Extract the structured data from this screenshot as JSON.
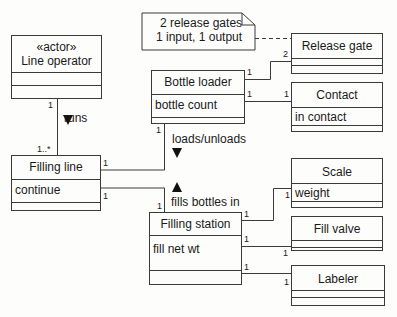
{
  "note": {
    "lines": [
      "2 release gates",
      "1 input, 1 output"
    ]
  },
  "classes": {
    "line_operator": {
      "stereotype": "«actor»",
      "name": "Line operator",
      "attributes": []
    },
    "release_gate": {
      "name": "Release gate",
      "attributes": []
    },
    "bottle_loader": {
      "name": "Bottle loader",
      "attributes": [
        "bottle count"
      ]
    },
    "contact": {
      "name": "Contact",
      "attributes": [
        "in contact"
      ]
    },
    "filling_line": {
      "name": "Filling line",
      "attributes": [
        "continue"
      ]
    },
    "filling_station": {
      "name": "Filling station",
      "attributes": [
        "fill net wt"
      ]
    },
    "scale": {
      "name": "Scale",
      "attributes": [
        "weight"
      ]
    },
    "fill_valve": {
      "name": "Fill valve",
      "attributes": []
    },
    "labeler": {
      "name": "Labeler",
      "attributes": []
    }
  },
  "associations": {
    "runs": {
      "label": "runs",
      "from": "Line operator",
      "to": "Filling line",
      "from_mult": "1",
      "to_mult": "1..*"
    },
    "loads": {
      "label": "loads/unloads",
      "from": "Bottle loader",
      "to": "Filling line",
      "from_mult": "1",
      "to_mult": "1"
    },
    "fills": {
      "label": "fills bottles in",
      "from": "Filling station",
      "to": "Filling line",
      "from_mult": "1",
      "to_mult": "1"
    },
    "loader_gate": {
      "from_mult": "1",
      "to_mult": "2"
    },
    "loader_contact": {
      "from_mult": "1",
      "to_mult": "1"
    },
    "station_scale": {
      "from_mult": "1",
      "to_mult": "1"
    },
    "station_valve": {
      "from_mult": "1",
      "to_mult": "1"
    },
    "station_labeler": {
      "from_mult": "1",
      "to_mult": "1"
    }
  }
}
